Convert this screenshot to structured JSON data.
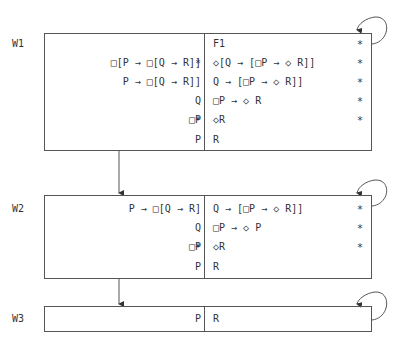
{
  "worlds": [
    {
      "label": "W1",
      "left": [
        {
          "text": "□[P → □[Q → R]]",
          "star": "*"
        },
        {
          "text": "P → □[Q → R]]",
          "star": ""
        },
        {
          "text": "Q",
          "star": ""
        },
        {
          "text": "□P",
          "star": "*"
        },
        {
          "text": "P",
          "star": ""
        }
      ],
      "right": [
        {
          "text": "F1",
          "star": "*"
        },
        {
          "text": "◇[Q → [□P → ◇ R]]",
          "star": "*"
        },
        {
          "text": "Q → [□P → ◇ R]]",
          "star": "*"
        },
        {
          "text": "□P → ◇ R",
          "star": "*"
        },
        {
          "text": "◇R",
          "star": "*"
        },
        {
          "text": "R",
          "star": ""
        }
      ]
    },
    {
      "label": "W2",
      "left": [
        {
          "text": "P → □[Q → R]",
          "star": ""
        },
        {
          "text": "Q",
          "star": ""
        },
        {
          "text": "□P",
          "star": "*"
        },
        {
          "text": "P",
          "star": ""
        }
      ],
      "right": [
        {
          "text": "Q → [□P → ◇ R]]",
          "star": "*"
        },
        {
          "text": "□P → ◇ P",
          "star": "*"
        },
        {
          "text": "◇R",
          "star": "*"
        },
        {
          "text": "R",
          "star": ""
        }
      ]
    },
    {
      "label": "W3",
      "left": [
        {
          "text": "P",
          "star": ""
        }
      ],
      "right": [
        {
          "text": "R",
          "star": ""
        }
      ]
    }
  ],
  "colors": {
    "line": "#555555",
    "text": "#333333"
  }
}
